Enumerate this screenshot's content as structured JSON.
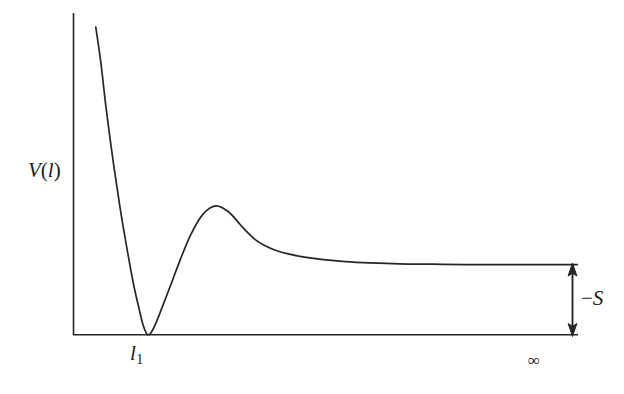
{
  "figure": {
    "background_color": "#ffffff",
    "line_color": "#262626",
    "text_color": "#1a1a1a"
  },
  "labels": {
    "y_axis": "V",
    "y_axis_arg": "(l)",
    "x_tick_min": "l",
    "x_tick_min_sub": "1",
    "x_tick_infinity": "∞",
    "bracket": "−S",
    "bracket_minus": "−",
    "bracket_symbol": "S"
  },
  "chart_data": {
    "type": "line",
    "title": "",
    "xlabel": "",
    "ylabel": "V(l)",
    "grid": false,
    "legend": null,
    "axis_style": "open L-shaped axes, no tick marks, no numeric scale",
    "xlim": [
      0,
      1
    ],
    "ylim": [
      0,
      1
    ],
    "xtick_labels": [
      "l₁",
      "∞"
    ],
    "xtick_positions": [
      0.137,
      0.927
    ],
    "annotations": [
      {
        "text": "−S",
        "type": "double-headed-vertical-arrow",
        "x": 0.99,
        "y_from": 0.0,
        "y_to": 0.217,
        "description": "Depth of the secondary minimum / plateau offset below the asymptotic value, measured from the baseline up to the curve plateau at infinity."
      }
    ],
    "series": [
      {
        "name": "V(l)",
        "description": "Interaction potential: steep repulsive wall at small separation, deep primary minimum touching zero at l1, secondary energy barrier (maximum), then monotonic decay to a constant plateau at infinite separation offset by S above the baseline.",
        "x": [
          0.041,
          0.05,
          0.06,
          0.072,
          0.085,
          0.098,
          0.11,
          0.12,
          0.128,
          0.134,
          0.137,
          0.142,
          0.15,
          0.162,
          0.178,
          0.196,
          0.216,
          0.238,
          0.262,
          0.285,
          0.307,
          0.322,
          0.335,
          0.35,
          0.37,
          0.395,
          0.425,
          0.46,
          0.5,
          0.545,
          0.6,
          0.66,
          0.72,
          0.79,
          0.86,
          0.927
        ],
        "y": [
          0.95,
          0.845,
          0.7,
          0.548,
          0.4,
          0.27,
          0.16,
          0.085,
          0.03,
          0.005,
          0.0,
          0.005,
          0.03,
          0.08,
          0.15,
          0.23,
          0.31,
          0.372,
          0.398,
          0.38,
          0.34,
          0.313,
          0.293,
          0.277,
          0.262,
          0.25,
          0.24,
          0.232,
          0.226,
          0.222,
          0.219,
          0.218,
          0.217,
          0.217,
          0.217,
          0.217
        ],
        "key_points": {
          "primary_minimum": {
            "x": 0.137,
            "y": 0.0,
            "label": "l₁"
          },
          "barrier_maximum": {
            "x": 0.262,
            "y": 0.398
          },
          "asymptote": {
            "x": 0.927,
            "y": 0.217,
            "label": "∞"
          }
        }
      }
    ]
  }
}
